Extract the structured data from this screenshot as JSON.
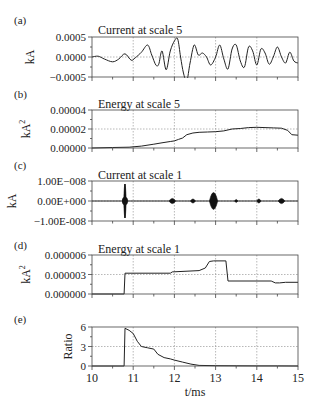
{
  "figure": {
    "xlabel": "t/ms",
    "xticks": [
      "10",
      "11",
      "12",
      "13",
      "14",
      "15"
    ]
  },
  "chart_data": [
    {
      "panel": "(a)",
      "type": "line",
      "title": "Current at scale 5",
      "xlabel": "t/ms",
      "ylabel": "kA",
      "xlim": [
        10,
        15
      ],
      "ylim": [
        -0.0005,
        0.0005
      ],
      "yticks": [
        "0.0005",
        "0.0000",
        "-0.0005"
      ],
      "grid": true,
      "x": [
        10.0,
        10.15,
        10.3,
        10.5,
        10.65,
        10.8,
        10.95,
        11.05,
        11.2,
        11.35,
        11.45,
        11.55,
        11.62,
        11.7,
        11.8,
        11.9,
        12.0,
        12.08,
        12.15,
        12.22,
        12.3,
        12.38,
        12.48,
        12.58,
        12.68,
        12.78,
        12.88,
        13.0,
        13.1,
        13.2,
        13.3,
        13.4,
        13.5,
        13.6,
        13.7,
        13.8,
        13.9,
        14.0,
        14.1,
        14.2,
        14.3,
        14.4,
        14.5,
        14.6,
        14.7,
        14.8,
        14.9,
        15.0
      ],
      "y": [
        0.0,
        2e-05,
        -5e-05,
        -0.00012,
        -5e-05,
        8e-05,
        -8e-05,
        -2e-05,
        0.00012,
        0.0003,
        5e-05,
        -0.0002,
        -0.00018,
        0.00015,
        -0.00032,
        0.00015,
        0.0004,
        0.00045,
        0.0,
        -0.0004,
        -0.0006,
        -0.00015,
        0.0003,
        5e-05,
        0.0001,
        0.0,
        -0.0002,
        0.0,
        0.0003,
        -5e-05,
        -0.0003,
        0.0002,
        0.0003,
        -0.0001,
        -0.00025,
        0.00025,
        0.00015,
        -0.0002,
        0.0002,
        0.0001,
        -0.00018,
        0.0,
        0.00025,
        0.0,
        -0.00015,
        0.00012,
        -0.0001,
        -0.00015
      ]
    },
    {
      "panel": "(b)",
      "type": "line",
      "title": "Energy at scale 5",
      "xlabel": "t/ms",
      "ylabel": "kA²",
      "xlim": [
        10,
        15
      ],
      "ylim": [
        0,
        4e-05
      ],
      "yticks": [
        "0.00004",
        "0.00002",
        "0.00000"
      ],
      "grid": true,
      "x": [
        10.0,
        10.5,
        10.9,
        11.2,
        11.5,
        11.7,
        11.9,
        12.0,
        12.1,
        12.2,
        12.3,
        12.45,
        12.6,
        12.8,
        13.0,
        13.2,
        13.4,
        13.6,
        13.8,
        14.0,
        14.2,
        14.4,
        14.6,
        14.75,
        14.85,
        15.0
      ],
      "y": [
        0.0,
        5e-07,
        8e-07,
        2e-06,
        4e-06,
        5.5e-06,
        6.8e-06,
        7.5e-06,
        9e-06,
        1.05e-05,
        1.4e-05,
        1.58e-05,
        1.65e-05,
        1.68e-05,
        1.72e-05,
        1.8e-05,
        2e-05,
        2.05e-05,
        2.15e-05,
        2.18e-05,
        2.15e-05,
        2.12e-05,
        2.08e-05,
        1.85e-05,
        1.4e-05,
        1.35e-05
      ]
    },
    {
      "panel": "(c)",
      "type": "line",
      "title": "Current at scale 1",
      "xlabel": "t/ms",
      "ylabel": "kA",
      "xlim": [
        10,
        15
      ],
      "ylim": [
        -1e-08,
        1e-08
      ],
      "yticks": [
        "1.00E-008",
        "0.00E+000",
        "-1.00E-008"
      ],
      "grid": true,
      "bursts": [
        {
          "t": 10.8,
          "amplitude": 8.5e-09,
          "width_ms": 0.03
        },
        {
          "t": 11.95,
          "amplitude": 1.3e-09,
          "width_ms": 0.08
        },
        {
          "t": 12.45,
          "amplitude": 1e-09,
          "width_ms": 0.06
        },
        {
          "t": 12.95,
          "amplitude": 4.2e-09,
          "width_ms": 0.1
        },
        {
          "t": 13.5,
          "amplitude": 7e-10,
          "width_ms": 0.04
        },
        {
          "t": 14.05,
          "amplitude": 1e-09,
          "width_ms": 0.05
        },
        {
          "t": 14.6,
          "amplitude": 1.3e-09,
          "width_ms": 0.08
        }
      ]
    },
    {
      "panel": "(d)",
      "type": "line",
      "title": "Energy at scale 1",
      "xlabel": "t/ms",
      "ylabel": "kA²",
      "xlim": [
        10,
        15
      ],
      "ylim": [
        0,
        6e-06
      ],
      "yticks": [
        "0.000006",
        "0.000003",
        "0.000000"
      ],
      "grid": true,
      "x": [
        10.0,
        10.78,
        10.8,
        11.9,
        11.95,
        12.6,
        12.75,
        12.85,
        12.95,
        13.25,
        13.3,
        14.35,
        14.45,
        14.55,
        14.7,
        15.0
      ],
      "y": [
        0.0,
        0.0,
        3.2e-06,
        3.2e-06,
        3.4e-06,
        3.6e-06,
        4e-06,
        5e-06,
        5.1e-06,
        5.1e-06,
        2e-06,
        2e-06,
        1.7e-06,
        1.7e-06,
        1.8e-06,
        1.8e-06
      ]
    },
    {
      "panel": "(e)",
      "type": "line",
      "title": "",
      "xlabel": "t/ms",
      "ylabel": "Ratio",
      "xlim": [
        10,
        15
      ],
      "ylim": [
        0,
        6
      ],
      "yticks": [
        "6",
        "3",
        "0"
      ],
      "xticks": [
        "10",
        "11",
        "12",
        "13",
        "14",
        "15"
      ],
      "grid": true,
      "x": [
        10.0,
        10.78,
        10.8,
        10.9,
        11.0,
        11.1,
        11.2,
        11.35,
        11.5,
        11.6,
        11.75,
        11.9,
        12.0,
        12.2,
        12.4,
        12.6,
        13.0,
        13.5,
        14.0,
        14.5,
        15.0
      ],
      "y": [
        0.0,
        0.0,
        5.8,
        5.5,
        5.0,
        3.8,
        3.0,
        2.8,
        2.6,
        1.8,
        1.3,
        1.1,
        0.9,
        0.6,
        0.3,
        0.1,
        0.05,
        0.03,
        0.02,
        0.01,
        0.0
      ]
    }
  ]
}
